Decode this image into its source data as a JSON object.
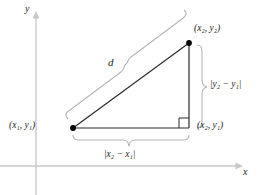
{
  "figure": {
    "colors": {
      "axis": "#c9c9c9",
      "triangle": "#2b2b2b",
      "brace": "#b5b5b5",
      "point": "#000000",
      "text": "#1c1c1c",
      "background": "#ffffff"
    },
    "axes": {
      "y_label": "y",
      "x_label": "x",
      "origin": {
        "x": 36,
        "y": 166
      }
    },
    "points": [
      {
        "name": "lower-left-vertex",
        "label_x": "x",
        "label_x_sub": "1",
        "label_y": "y",
        "label_y_sub": "1",
        "px": 73,
        "py": 128
      },
      {
        "name": "upper-right-vertex",
        "label_x": "x",
        "label_x_sub": "2",
        "label_y": "y",
        "label_y_sub": "2",
        "px": 189,
        "py": 43
      },
      {
        "name": "right-angle-vertex",
        "label_x": "x",
        "label_x_sub": "2",
        "label_y": "y",
        "label_y_sub": "1",
        "px": 189,
        "py": 128
      }
    ],
    "labels": {
      "point1": "(x₁, y₁)",
      "point2": "(x₂, y₂)",
      "point3": "(x₂, y₁)",
      "hypotenuse": "d",
      "vertical_leg": "|y₂ − y₁|",
      "horizontal_leg": "|x₂ − x₁|"
    },
    "parts": {
      "open_paren": "(",
      "close_paren": ")",
      "comma": ", ",
      "abs_bar": "|",
      "minus": "−",
      "var_x": "x",
      "var_y": "y",
      "sub_1": "1",
      "sub_2": "2"
    },
    "markers": {
      "right_angle": "right-angle-square"
    }
  }
}
